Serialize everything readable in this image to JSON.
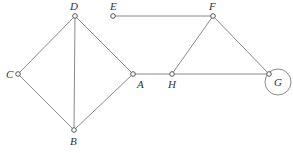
{
  "diagram": {
    "type": "graph",
    "nodes": [
      {
        "id": "A",
        "label": "A",
        "x": 133,
        "y": 74,
        "lx": 137,
        "ly": 88
      },
      {
        "id": "B",
        "label": "B",
        "x": 74,
        "y": 130,
        "lx": 70,
        "ly": 145
      },
      {
        "id": "C",
        "label": "C",
        "x": 18,
        "y": 74,
        "lx": 6,
        "ly": 78
      },
      {
        "id": "D",
        "label": "D",
        "x": 75,
        "y": 16,
        "lx": 70,
        "ly": 10
      },
      {
        "id": "E",
        "label": "E",
        "x": 113,
        "y": 16,
        "lx": 110,
        "ly": 10
      },
      {
        "id": "F",
        "label": "F",
        "x": 213,
        "y": 16,
        "lx": 209,
        "ly": 10
      },
      {
        "id": "G",
        "label": "G",
        "x": 269,
        "y": 74,
        "lx": 274,
        "ly": 86
      },
      {
        "id": "H",
        "label": "H",
        "x": 172,
        "y": 74,
        "lx": 168,
        "ly": 88
      }
    ],
    "edges": [
      {
        "from": "D",
        "to": "C"
      },
      {
        "from": "D",
        "to": "B"
      },
      {
        "from": "D",
        "to": "A"
      },
      {
        "from": "C",
        "to": "B"
      },
      {
        "from": "B",
        "to": "A"
      },
      {
        "from": "A",
        "to": "H"
      },
      {
        "from": "H",
        "to": "G"
      },
      {
        "from": "H",
        "to": "F"
      },
      {
        "from": "E",
        "to": "F"
      },
      {
        "from": "F",
        "to": "G"
      }
    ],
    "loops": [
      {
        "node": "G",
        "cx": 278,
        "cy": 82,
        "r": 13
      }
    ]
  }
}
